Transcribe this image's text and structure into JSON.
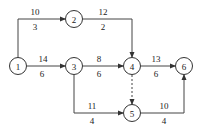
{
  "nodes": [
    {
      "id": "1",
      "label": "1",
      "x": 18,
      "y": 66
    },
    {
      "id": "2",
      "label": "2",
      "x": 74,
      "y": 19
    },
    {
      "id": "3",
      "label": "3",
      "x": 74,
      "y": 66
    },
    {
      "id": "4",
      "label": "4",
      "x": 132,
      "y": 66
    },
    {
      "id": "5",
      "label": "5",
      "x": 132,
      "y": 113
    },
    {
      "id": "6",
      "label": "6",
      "x": 184,
      "y": 66
    }
  ],
  "edges": [
    {
      "from": "1",
      "to": "2",
      "top": "10",
      "bottom": "3",
      "dashed": false
    },
    {
      "from": "2",
      "to": "4",
      "top": "12",
      "bottom": "2",
      "dashed": false
    },
    {
      "from": "1",
      "to": "3",
      "top": "14",
      "bottom": "6",
      "dashed": false
    },
    {
      "from": "3",
      "to": "4",
      "top": "8",
      "bottom": "6",
      "dashed": false
    },
    {
      "from": "4",
      "to": "6",
      "top": "13",
      "bottom": "6",
      "dashed": false
    },
    {
      "from": "3",
      "to": "5",
      "top": "11",
      "bottom": "4",
      "dashed": false
    },
    {
      "from": "4",
      "to": "5",
      "top": "",
      "bottom": "",
      "dashed": true
    },
    {
      "from": "5",
      "to": "6",
      "top": "10",
      "bottom": "4",
      "dashed": false
    }
  ]
}
